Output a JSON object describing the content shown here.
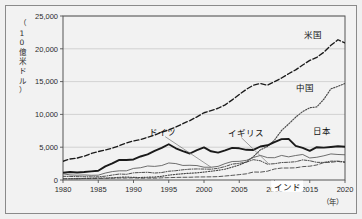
{
  "figure": {
    "unit_label": "（10億米ドル）",
    "unit_label_chars": [
      "（",
      "1",
      "0",
      "億",
      "米",
      "ド",
      "ル",
      "）"
    ],
    "xaxis_unit": "（年）"
  },
  "chart_data": {
    "type": "line",
    "title": "",
    "subtitle": "",
    "xlabel": "（年）",
    "ylabel": "（10億米ドル）",
    "xlim": [
      1980,
      2020
    ],
    "ylim": [
      0,
      25000
    ],
    "yticks": [
      0,
      5000,
      10000,
      15000,
      20000,
      25000
    ],
    "ytick_labels": [
      "0",
      "5,000",
      "10,000",
      "15,000",
      "20,000",
      "25,000"
    ],
    "xticks": [
      1980,
      1985,
      1990,
      1995,
      2000,
      2005,
      2010,
      2015,
      2020
    ],
    "xtick_labels": [
      "1980",
      "1985",
      "1990",
      "1995",
      "2000",
      "2005",
      "2010",
      "2015",
      "2020"
    ],
    "grid": "horizontal",
    "legend_position": "inline-annotations",
    "x": [
      1980,
      1981,
      1982,
      1983,
      1984,
      1985,
      1986,
      1987,
      1988,
      1989,
      1990,
      1991,
      1992,
      1993,
      1994,
      1995,
      1996,
      1997,
      1998,
      1999,
      2000,
      2001,
      2002,
      2003,
      2004,
      2005,
      2006,
      2007,
      2008,
      2009,
      2010,
      2011,
      2012,
      2013,
      2014,
      2015,
      2016,
      2017,
      2018,
      2019,
      2020
    ],
    "series": [
      {
        "name": "米国",
        "label": "米国",
        "style": "dashed",
        "color": "#1a1a1a",
        "values": [
          2857,
          3207,
          3344,
          3634,
          4038,
          4339,
          4580,
          4855,
          5236,
          5642,
          5963,
          6158,
          6520,
          6859,
          7287,
          7640,
          8073,
          8578,
          9063,
          9631,
          10252,
          10582,
          10936,
          11458,
          12214,
          13037,
          13815,
          14452,
          14713,
          14449,
          14992,
          15543,
          16197,
          16785,
          17527,
          18225,
          18695,
          19477,
          20533,
          21381,
          20894
        ]
      },
      {
        "name": "中国",
        "label": "中国",
        "style": "dotted",
        "color": "#4a4a4a",
        "values": [
          191,
          196,
          205,
          230,
          260,
          310,
          300,
          327,
          410,
          459,
          395,
          383,
          427,
          445,
          564,
          734,
          863,
          962,
          1029,
          1094,
          1211,
          1339,
          1471,
          1660,
          1955,
          2286,
          2752,
          3550,
          4594,
          5102,
          6087,
          7552,
          8532,
          9570,
          10438,
          11016,
          11138,
          12310,
          13895,
          14280,
          14723
        ]
      },
      {
        "name": "日本",
        "label": "日本",
        "style": "solid-thick",
        "color": "#1a1a1a",
        "values": [
          1105,
          1220,
          1134,
          1211,
          1319,
          1399,
          2081,
          2533,
          3072,
          3054,
          3133,
          3585,
          3909,
          4455,
          4907,
          5449,
          4834,
          4415,
          4041,
          4563,
          4968,
          4375,
          4182,
          4519,
          4893,
          4831,
          4601,
          4579,
          5106,
          5289,
          5759,
          6233,
          6272,
          5212,
          4897,
          4445,
          5003,
          4931,
          5041,
          5149,
          5065
        ]
      },
      {
        "name": "ドイツ",
        "label": "ドイツ",
        "style": "thin-solid",
        "color": "#555555",
        "values": [
          950,
          775,
          732,
          769,
          717,
          735,
          1060,
          1285,
          1400,
          1399,
          1765,
          1869,
          2132,
          2073,
          2205,
          2594,
          2502,
          2219,
          2244,
          2199,
          1950,
          1945,
          2079,
          2505,
          2819,
          2846,
          2995,
          3425,
          3745,
          3412,
          3397,
          3744,
          3527,
          3733,
          3890,
          3357,
          3468,
          3690,
          3974,
          3888,
          3846
        ]
      },
      {
        "name": "イギリス",
        "label": "イギリス",
        "style": "dash-dot",
        "color": "#3a3a3a",
        "values": [
          565,
          545,
          514,
          500,
          477,
          489,
          584,
          755,
          910,
          868,
          1093,
          1143,
          1180,
          1061,
          1137,
          1336,
          1416,
          1560,
          1651,
          1688,
          1666,
          1646,
          1788,
          2053,
          2421,
          2543,
          2713,
          3100,
          2929,
          2412,
          2485,
          2660,
          2705,
          2786,
          3065,
          2935,
          2694,
          2680,
          2871,
          2879,
          2760
        ]
      },
      {
        "name": "インド",
        "label": "インド",
        "style": "long-dash-fine",
        "color": "#444444",
        "values": [
          186,
          193,
          200,
          218,
          212,
          232,
          249,
          279,
          297,
          296,
          321,
          270,
          288,
          279,
          327,
          360,
          392,
          415,
          421,
          459,
          468,
          485,
          515,
          608,
          709,
          820,
          940,
          1217,
          1199,
          1342,
          1676,
          1823,
          1828,
          1857,
          2039,
          2104,
          2295,
          2651,
          2703,
          2831,
          2668
        ]
      }
    ],
    "annotations": [
      {
        "text": "米国",
        "x": 2014.2,
        "y": 22100,
        "leader": false
      },
      {
        "text": "中国",
        "x": 2013.0,
        "y": 14100,
        "leader": false
      },
      {
        "text": "日本",
        "x": 2015.4,
        "y": 7450,
        "leader": false
      },
      {
        "text": "ドイツ",
        "x": 1992.2,
        "y": 7250,
        "leader": true
      },
      {
        "text": "イギリス",
        "x": 2003.4,
        "y": 7150,
        "leader": true
      },
      {
        "text": "インド",
        "x": 2011.8,
        "y": -1100,
        "leader": false
      }
    ]
  }
}
